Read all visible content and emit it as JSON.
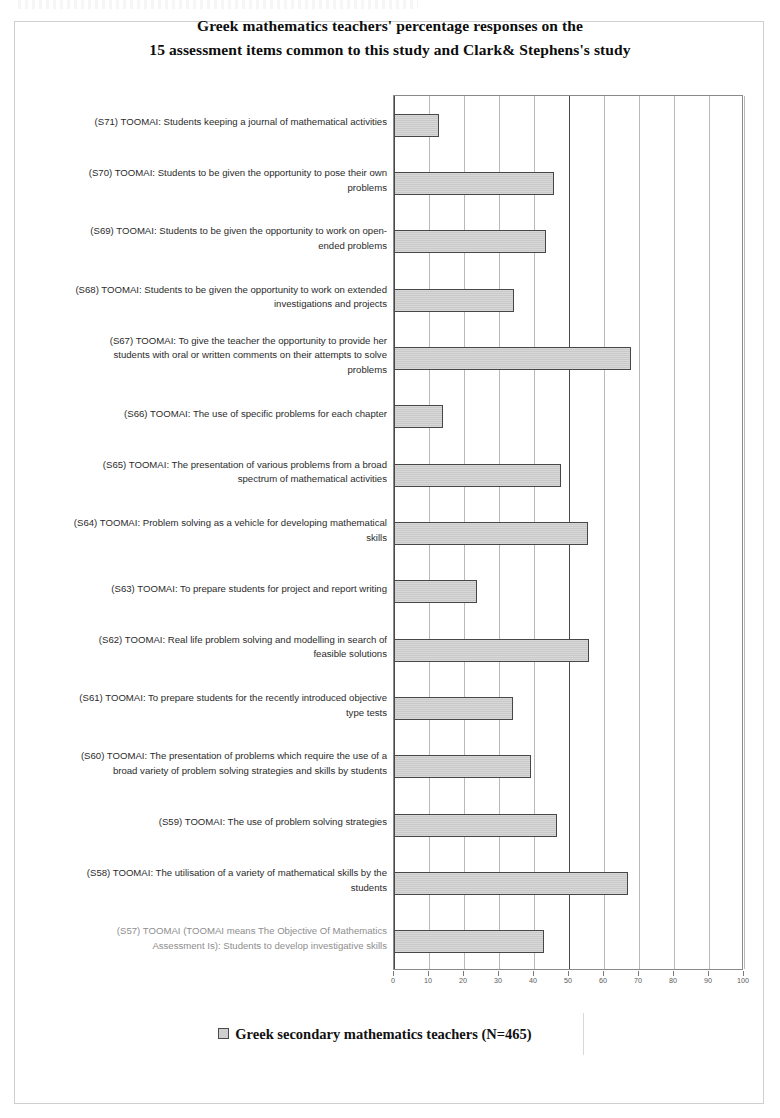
{
  "title": {
    "line1": "Greek mathematics teachers' percentage responses on the",
    "line2": "15 assessment items common to this study and Clark& Stephens's study"
  },
  "legend": {
    "swatch_icon": "legend-square-icon",
    "label": "Greek secondary mathematics teachers (N=465)",
    "color": "#c9c9c9"
  },
  "axis": {
    "ticks": [
      "0",
      "10",
      "20",
      "30",
      "40",
      "50",
      "60",
      "70",
      "80",
      "90",
      "100"
    ]
  },
  "chart_data": {
    "type": "bar",
    "orientation": "horizontal",
    "title": "Greek mathematics teachers' percentage responses on the 15 assessment items common to this study and Clark& Stephens's study",
    "xlabel": "",
    "ylabel": "",
    "xlim": [
      0,
      100
    ],
    "grid": true,
    "legend_position": "bottom",
    "series": [
      {
        "name": "Greek secondary mathematics teachers (N=465)",
        "color": "#c9c9c9",
        "values": [
          12.9,
          45.8,
          43.4,
          34.2,
          67.6,
          13.9,
          47.6,
          55.4,
          23.7,
          55.6,
          33.9,
          39.0,
          46.6,
          66.8,
          42.8
        ]
      }
    ],
    "categories": [
      "(S71) TOOMAI: Students keeping a journal of mathematical activities",
      "(S70) TOOMAI: Students to be given the opportunity to pose their own problems",
      "(S69) TOOMAI: Students to be given the opportunity to work on open-ended problems",
      "(S68) TOOMAI: Students to be given the opportunity to work on extended investigations and projects",
      "(S67) TOOMAI: To give the teacher the opportunity to provide her students with oral or written comments on their attempts to solve problems",
      "(S66) TOOMAI: The use of specific problems for each chapter",
      "(S65) TOOMAI: The presentation of various problems from a broad spectrum of mathematical activities",
      "(S64) TOOMAI: Problem solving as a vehicle for developing mathematical skills",
      "(S63) TOOMAI: To prepare students for project and report writing",
      "(S62) TOOMAI: Real life problem solving and modelling in search of feasible solutions",
      "(S61) TOOMAI: To prepare students for the recently introduced objective type tests",
      "(S60) TOOMAI: The presentation of problems which require the use of a broad variety of problem solving strategies and skills by students",
      "(S59) TOOMAI: The use of problem solving strategies",
      "(S58) TOOMAI: The utilisation of a variety of mathematical skills by the students",
      "(S57) TOOMAI (TOOMAI means  The Objective Of Mathematics Assessment Is): Students to develop investigative skills"
    ]
  },
  "rows": [
    {
      "id": "s71",
      "lines": [
        "(S71) TOOMAI: Students keeping a journal of mathematical activities"
      ],
      "value": 12.9,
      "faint": false
    },
    {
      "id": "s70",
      "lines": [
        "(S70) TOOMAI: Students to be given the opportunity to pose their own",
        "problems"
      ],
      "value": 45.8,
      "faint": false
    },
    {
      "id": "s69",
      "lines": [
        "(S69) TOOMAI: Students to be given the opportunity to work on open-",
        "ended problems"
      ],
      "value": 43.4,
      "faint": false
    },
    {
      "id": "s68",
      "lines": [
        "(S68) TOOMAI: Students to be given the opportunity to work on extended",
        "investigations and projects"
      ],
      "value": 34.2,
      "faint": false
    },
    {
      "id": "s67",
      "lines": [
        "(S67) TOOMAI: To give the teacher the opportunity to provide her",
        "students with oral or written comments on their attempts to solve",
        "problems"
      ],
      "value": 67.6,
      "faint": false
    },
    {
      "id": "s66",
      "lines": [
        "(S66) TOOMAI: The use of specific problems for each chapter"
      ],
      "value": 13.9,
      "faint": false
    },
    {
      "id": "s65",
      "lines": [
        "(S65) TOOMAI: The presentation of various problems from a broad",
        "spectrum of mathematical activities"
      ],
      "value": 47.6,
      "faint": false
    },
    {
      "id": "s64",
      "lines": [
        "(S64) TOOMAI: Problem solving as a vehicle for developing mathematical",
        "skills"
      ],
      "value": 55.4,
      "faint": false
    },
    {
      "id": "s63",
      "lines": [
        "(S63) TOOMAI: To prepare students for project and report writing"
      ],
      "value": 23.7,
      "faint": false
    },
    {
      "id": "s62",
      "lines": [
        "(S62) TOOMAI: Real life problem solving and modelling in search of",
        "feasible solutions"
      ],
      "value": 55.6,
      "faint": false
    },
    {
      "id": "s61",
      "lines": [
        "(S61) TOOMAI: To prepare students for the recently introduced objective",
        "type tests"
      ],
      "value": 33.9,
      "faint": false
    },
    {
      "id": "s60",
      "lines": [
        "(S60) TOOMAI: The presentation of problems which require the use of a",
        "broad variety of problem solving strategies and skills by students"
      ],
      "value": 39.0,
      "faint": false
    },
    {
      "id": "s59",
      "lines": [
        "(S59) TOOMAI: The use of problem solving strategies"
      ],
      "value": 46.6,
      "faint": false
    },
    {
      "id": "s58",
      "lines": [
        "(S58) TOOMAI: The utilisation of a variety of mathematical skills by the",
        "students"
      ],
      "value": 66.8,
      "faint": false
    },
    {
      "id": "s57",
      "lines": [
        "(S57) TOOMAI (TOOMAI means  The Objective Of Mathematics",
        "Assessment Is): Students to develop investigative skills"
      ],
      "value": 42.8,
      "faint": true
    }
  ]
}
